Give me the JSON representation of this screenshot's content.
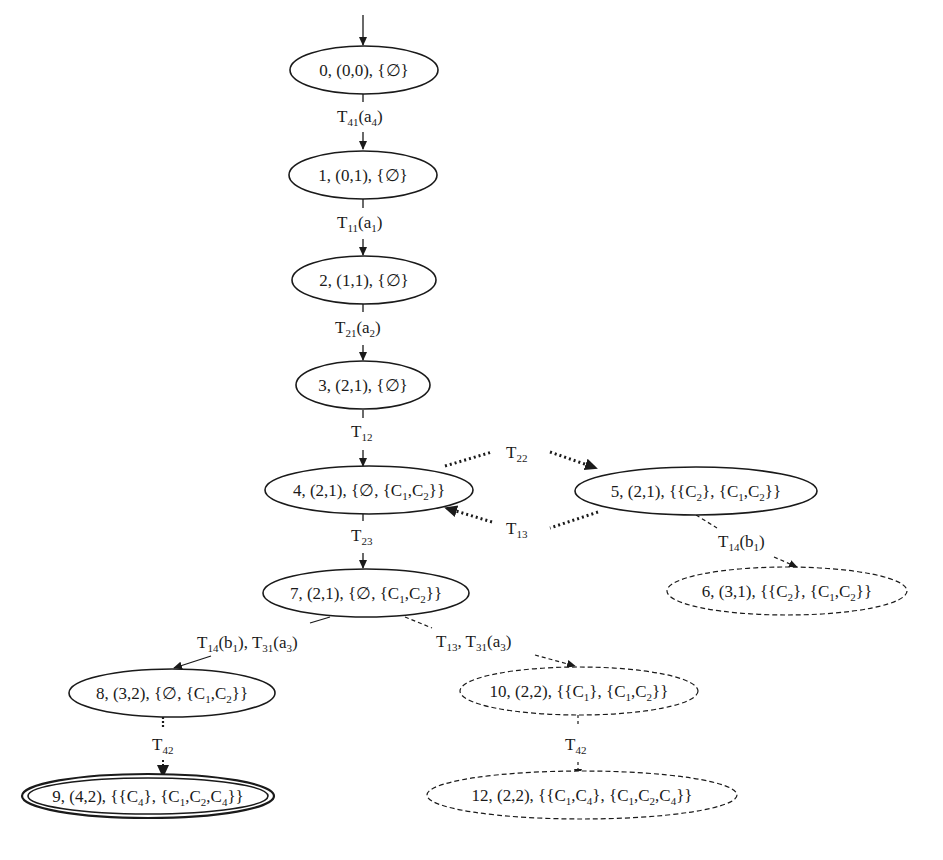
{
  "diagram": {
    "type": "state-transition-graph",
    "nodes": [
      {
        "id": "0",
        "label": "0, (0,0), {∅}",
        "style": "solid"
      },
      {
        "id": "1",
        "label": "1, (0,1), {∅}",
        "style": "solid"
      },
      {
        "id": "2",
        "label": "2, (1,1), {∅}",
        "style": "solid"
      },
      {
        "id": "3",
        "label": "3, (2,1), {∅}",
        "style": "solid"
      },
      {
        "id": "4",
        "label": "4, (2,1), {∅, {C1,C2}}",
        "style": "solid"
      },
      {
        "id": "5",
        "label": "5, (2,1), {{C2}, {C1,C2}}",
        "style": "solid"
      },
      {
        "id": "6",
        "label": "6, (3,1), {{C2}, {C1,C2}}",
        "style": "dashed"
      },
      {
        "id": "7",
        "label": "7, (2,1), {∅, {C1,C2}}",
        "style": "solid"
      },
      {
        "id": "8",
        "label": "8, (3,2), {∅, {C1,C2}}",
        "style": "solid"
      },
      {
        "id": "9",
        "label": "9, (4,2), {{C4}, {C1,C2,C4}}",
        "style": "double"
      },
      {
        "id": "10",
        "label": "10, (2,2), {{C1}, {C1,C2}}",
        "style": "dashed"
      },
      {
        "id": "12",
        "label": "12, (2,2), {{C1,C4}, {C1,C2,C4}}",
        "style": "dashed"
      }
    ],
    "edges": [
      {
        "from": "start",
        "to": "0",
        "label": "",
        "style": "solid"
      },
      {
        "from": "0",
        "to": "1",
        "label": "T41(a4)",
        "style": "solid"
      },
      {
        "from": "1",
        "to": "2",
        "label": "T11(a1)",
        "style": "solid"
      },
      {
        "from": "2",
        "to": "3",
        "label": "T21(a2)",
        "style": "solid"
      },
      {
        "from": "3",
        "to": "4",
        "label": "T12",
        "style": "solid"
      },
      {
        "from": "4",
        "to": "5",
        "label": "T22",
        "style": "dotted"
      },
      {
        "from": "5",
        "to": "4",
        "label": "T13",
        "style": "dotted"
      },
      {
        "from": "5",
        "to": "6",
        "label": "T14(b1)",
        "style": "dashed"
      },
      {
        "from": "4",
        "to": "7",
        "label": "T23",
        "style": "solid"
      },
      {
        "from": "7",
        "to": "8",
        "label": "T14(b1), T31(a3)",
        "style": "solid"
      },
      {
        "from": "7",
        "to": "10",
        "label": "T13, T31(a3)",
        "style": "dashed"
      },
      {
        "from": "8",
        "to": "9",
        "label": "T42",
        "style": "dotted"
      },
      {
        "from": "10",
        "to": "12",
        "label": "T42",
        "style": "dashed"
      }
    ]
  }
}
